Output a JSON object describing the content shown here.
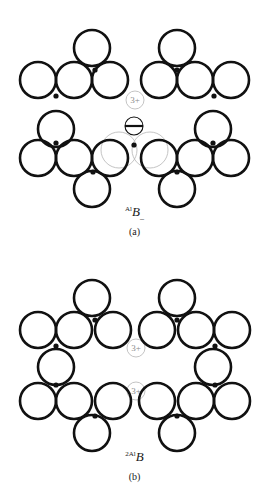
{
  "document": {
    "type": "crystal-lattice-defect-diagram",
    "background_color": "#ffffff",
    "ink_color": "#111111",
    "faint_color": "#b5b5b5"
  },
  "style": {
    "ion_radius": 18,
    "ion_stroke_width": 2.6,
    "dot_radius": 2.6,
    "vacancy_marker_radius": 9,
    "ghost_stroke_width": 0.8
  },
  "figures": [
    {
      "id": "figure-a",
      "panel_label": "(a)",
      "formula": {
        "pre_superscript": "Al",
        "element": "B",
        "post_subscript": "_"
      },
      "charge_labels": [
        {
          "text": "3+",
          "x": 135,
          "y": 100
        }
      ],
      "ions": [
        {
          "cx": 38,
          "cy": 80
        },
        {
          "cx": 74,
          "cy": 80
        },
        {
          "cx": 110,
          "cy": 80
        },
        {
          "cx": 159,
          "cy": 80
        },
        {
          "cx": 195,
          "cy": 80
        },
        {
          "cx": 231,
          "cy": 80
        },
        {
          "cx": 92,
          "cy": 48
        },
        {
          "cx": 177,
          "cy": 48
        },
        {
          "cx": 56,
          "cy": 129
        },
        {
          "cx": 213,
          "cy": 129
        },
        {
          "cx": 38,
          "cy": 158
        },
        {
          "cx": 74,
          "cy": 158
        },
        {
          "cx": 110,
          "cy": 158
        },
        {
          "cx": 159,
          "cy": 158
        },
        {
          "cx": 195,
          "cy": 158
        },
        {
          "cx": 231,
          "cy": 158
        },
        {
          "cx": 92,
          "cy": 189
        },
        {
          "cx": 177,
          "cy": 189
        }
      ],
      "ghost_ions": [
        {
          "cx": 119,
          "cy": 150
        },
        {
          "cx": 150,
          "cy": 150
        }
      ],
      "interstitial": {
        "cx": 134,
        "cy": 126,
        "r": 9,
        "has_bar": true
      },
      "dots": [
        {
          "cx": 56,
          "cy": 96
        },
        {
          "cx": 95,
          "cy": 70
        },
        {
          "cx": 177,
          "cy": 70
        },
        {
          "cx": 214,
          "cy": 96
        },
        {
          "cx": 56,
          "cy": 143
        },
        {
          "cx": 213,
          "cy": 143
        },
        {
          "cx": 93,
          "cy": 172
        },
        {
          "cx": 177,
          "cy": 172
        },
        {
          "cx": 134,
          "cy": 145
        }
      ]
    },
    {
      "id": "figure-b",
      "panel_label": "(b)",
      "formula": {
        "pre_superscript": "2Al",
        "element": "B",
        "post_subscript": ""
      },
      "charge_labels": [
        {
          "text": "3+",
          "x": 136,
          "y": 98
        },
        {
          "text": "3+",
          "x": 136,
          "y": 141
        }
      ],
      "ions": [
        {
          "cx": 38,
          "cy": 80
        },
        {
          "cx": 74,
          "cy": 80
        },
        {
          "cx": 113,
          "cy": 80
        },
        {
          "cx": 157,
          "cy": 80
        },
        {
          "cx": 196,
          "cy": 80
        },
        {
          "cx": 232,
          "cy": 80
        },
        {
          "cx": 92,
          "cy": 48
        },
        {
          "cx": 177,
          "cy": 48
        },
        {
          "cx": 56,
          "cy": 117
        },
        {
          "cx": 213,
          "cy": 117
        },
        {
          "cx": 38,
          "cy": 151
        },
        {
          "cx": 74,
          "cy": 151
        },
        {
          "cx": 113,
          "cy": 151
        },
        {
          "cx": 157,
          "cy": 151
        },
        {
          "cx": 196,
          "cy": 151
        },
        {
          "cx": 232,
          "cy": 151
        },
        {
          "cx": 92,
          "cy": 183
        },
        {
          "cx": 177,
          "cy": 183
        }
      ],
      "ghost_ions": [],
      "interstitial": null,
      "dots": [
        {
          "cx": 56,
          "cy": 96
        },
        {
          "cx": 95,
          "cy": 70
        },
        {
          "cx": 177,
          "cy": 70
        },
        {
          "cx": 215,
          "cy": 96
        },
        {
          "cx": 56,
          "cy": 135
        },
        {
          "cx": 215,
          "cy": 135
        },
        {
          "cx": 95,
          "cy": 166
        },
        {
          "cx": 177,
          "cy": 166
        }
      ]
    }
  ]
}
